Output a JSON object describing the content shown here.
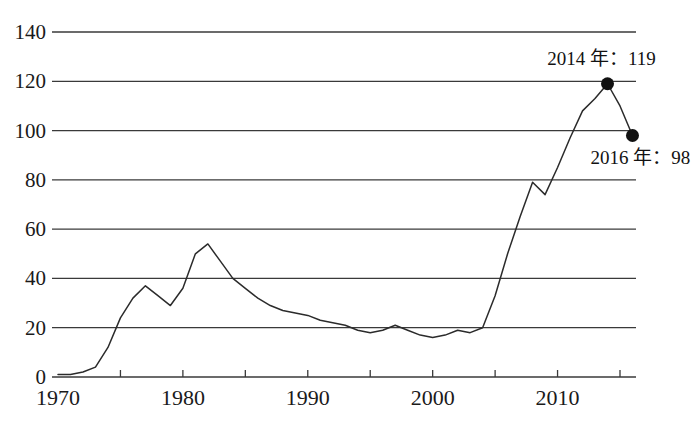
{
  "chart_data": {
    "type": "line",
    "title": "",
    "xlabel": "",
    "ylabel": "",
    "xlim": [
      1970,
      2016
    ],
    "ylim": [
      0,
      140
    ],
    "grid": "horizontal",
    "legend": "none",
    "y_ticks": [
      0,
      20,
      40,
      60,
      80,
      100,
      120,
      140
    ],
    "y_tick_labels": [
      "0",
      "20",
      "40",
      "60",
      "80",
      "100",
      "120",
      "140"
    ],
    "x_ticks": [
      1970,
      1975,
      1980,
      1985,
      1990,
      1995,
      2000,
      2005,
      2010,
      2015
    ],
    "x_tick_labels_shown": [
      "1970",
      "1980",
      "1990",
      "2000",
      "2010"
    ],
    "x_major_ticks": [
      1970,
      1980,
      1990,
      2000,
      2010
    ],
    "x": [
      1970,
      1971,
      1972,
      1973,
      1974,
      1975,
      1976,
      1977,
      1978,
      1979,
      1980,
      1981,
      1982,
      1983,
      1984,
      1985,
      1986,
      1987,
      1988,
      1989,
      1990,
      1991,
      1992,
      1993,
      1994,
      1995,
      1996,
      1997,
      1998,
      1999,
      2000,
      2001,
      2002,
      2003,
      2004,
      2005,
      2006,
      2007,
      2008,
      2009,
      2010,
      2011,
      2012,
      2013,
      2014,
      2015,
      2016
    ],
    "values": [
      1,
      1,
      2,
      4,
      12,
      24,
      32,
      37,
      33,
      29,
      36,
      50,
      54,
      47,
      40,
      36,
      32,
      29,
      27,
      26,
      25,
      23,
      22,
      21,
      19,
      18,
      19,
      21,
      19,
      17,
      16,
      17,
      19,
      18,
      20,
      33,
      50,
      65,
      79,
      74,
      85,
      97,
      108,
      113,
      119,
      110,
      98
    ],
    "series": [
      {
        "name": "series-1",
        "values": [
          1,
          1,
          2,
          4,
          12,
          24,
          32,
          37,
          33,
          29,
          36,
          50,
          54,
          47,
          40,
          36,
          32,
          29,
          27,
          26,
          25,
          23,
          22,
          21,
          19,
          18,
          19,
          21,
          19,
          17,
          16,
          17,
          19,
          18,
          20,
          33,
          50,
          65,
          79,
          74,
          85,
          97,
          108,
          113,
          119,
          110,
          98
        ]
      }
    ],
    "annotations": [
      {
        "id": "peak-2014",
        "label": "2014 年：119",
        "x": 2014,
        "y": 119,
        "marker": true
      },
      {
        "id": "end-2016",
        "label": "2016 年：98",
        "x": 2016,
        "y": 98,
        "marker": true
      }
    ],
    "colors": {
      "line": "#2b2b2b",
      "grid": "#3a3a3a",
      "marker": "#111111",
      "background": "#ffffff",
      "text": "#1a1a1a"
    }
  }
}
